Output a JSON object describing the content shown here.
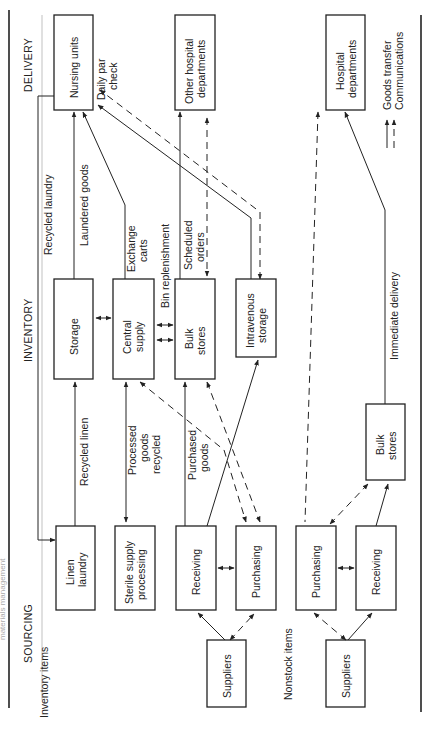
{
  "figure": {
    "edge_caption": "materials management",
    "columns": {
      "delivery": "DELIVERY",
      "inventory": "INVENTORY",
      "sourcing": "SOURCING"
    },
    "sections": {
      "inventory_items": "Inventory items",
      "nonstock_items": "Nonstock items"
    },
    "legend": {
      "goods_transfer": "Goods transfer",
      "communications": "Communications"
    },
    "boxes": {
      "nursing_units": "Nursing units",
      "other_hospital_1": "Other hospital",
      "other_hospital_2": "departments",
      "hospital_departments_1": "Hospital",
      "hospital_departments_2": "departments",
      "storage": "Storage",
      "central_supply_1": "Central",
      "central_supply_2": "supply",
      "bulk_stores_1": "Bulk",
      "bulk_stores_2": "stores",
      "iv_storage_1": "Intravenous",
      "iv_storage_2": "storage",
      "linen_laundry_1": "Linen",
      "linen_laundry_2": "laundry",
      "sterile_1": "Sterile supply",
      "sterile_2": "processing",
      "receiving": "Receiving",
      "purchasing": "Purchasing",
      "suppliers": "Suppliers",
      "ns_purchasing": "Purchasing",
      "ns_receiving": "Receiving",
      "ns_suppliers": "Suppliers",
      "ns_bulk_1": "Bulk",
      "ns_bulk_2": "stores"
    },
    "flow_labels": {
      "daily_par_1": "Daily par",
      "daily_par_2": "check",
      "recycled_laundry": "Recycled laundry",
      "laundered_goods": "Laundered goods",
      "exchange_1": "Exchange",
      "exchange_2": "carts",
      "bin_replenishment": "Bin replenishment",
      "scheduled_1": "Scheduled",
      "scheduled_2": "orders",
      "recycled_linen": "Recycled linen",
      "processed_1": "Processed",
      "processed_2": "goods",
      "processed_3": "recycled",
      "purchased_1": "Purchased",
      "purchased_2": "goods",
      "immediate_delivery": "Immediate delivery"
    }
  }
}
